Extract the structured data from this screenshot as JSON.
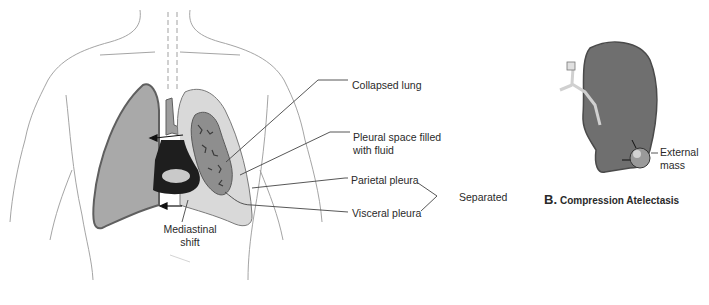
{
  "figure": {
    "panel_a": {
      "labels": {
        "collapsed_lung": "Collapsed lung",
        "pleural_space_line1": "Pleural space filled",
        "pleural_space_line2": "with fluid",
        "parietal_pleura": "Parietal pleura",
        "visceral_pleura": "Visceral pleura",
        "separated": "Separated",
        "mediastinal_line1": "Mediastinal",
        "mediastinal_line2": "shift"
      }
    },
    "panel_b": {
      "letter": "B.",
      "title": "Compression Atelectasis",
      "labels": {
        "external_line1": "External",
        "external_line2": "mass"
      }
    },
    "colors": {
      "outline": "#8a8a8a",
      "healthy_lung_fill": "#a9a9a9",
      "healthy_lung_stroke": "#5f5f5f",
      "pleural_fluid_fill": "#d9d9d9",
      "collapsed_lung_fill": "#8e8e8e",
      "mediastinum_fill": "#1e1e1e",
      "leader_line": "#444444"
    }
  }
}
